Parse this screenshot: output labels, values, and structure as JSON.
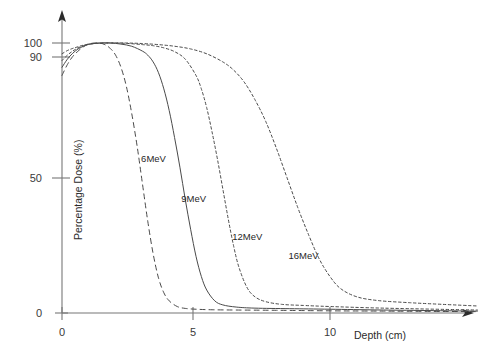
{
  "chart_data": {
    "type": "line",
    "title": "",
    "subtitle": "",
    "xlabel": "Depth (cm)",
    "ylabel": "Percentage Dose (%)",
    "xlim": [
      0,
      15.5
    ],
    "ylim": [
      0,
      108
    ],
    "xticks": [
      0,
      5,
      10
    ],
    "xticklabels": [
      "0",
      "5",
      "10"
    ],
    "yticks": [
      0,
      50,
      90,
      100
    ],
    "yticklabels": [
      "0",
      "50",
      "90",
      "100"
    ],
    "grid": false,
    "legend_position": "inline-annotations",
    "annotations": [
      {
        "text": "6MeV",
        "x": 2.95,
        "y": 56
      },
      {
        "text": "9MeV",
        "x": 4.45,
        "y": 41
      },
      {
        "text": "12MeV",
        "x": 6.35,
        "y": 27
      },
      {
        "text": "16MeV",
        "x": 8.45,
        "y": 20
      }
    ],
    "series": [
      {
        "name": "6MeV",
        "style": "dashed",
        "x": [
          0.0,
          0.2,
          0.4,
          0.6,
          0.8,
          1.0,
          1.2,
          1.4,
          1.6,
          1.8,
          2.0,
          2.2,
          2.4,
          2.6,
          2.8,
          3.0,
          3.2,
          3.4,
          3.6,
          3.8,
          4.0,
          4.3,
          4.6,
          5.0,
          5.6,
          6.5,
          8.0,
          10.0,
          12.0,
          15.5
        ],
        "y": [
          88,
          92,
          95,
          97,
          98.6,
          99.6,
          100,
          100,
          99.4,
          98,
          95.5,
          91,
          84,
          74,
          62,
          48,
          34,
          22,
          13,
          7.5,
          4.5,
          2.4,
          1.7,
          1.4,
          1.2,
          1.1,
          1.0,
          0.8,
          0.7,
          0.5
        ]
      },
      {
        "name": "9MeV",
        "style": "solid",
        "x": [
          0.0,
          0.2,
          0.4,
          0.6,
          0.8,
          1.0,
          1.4,
          1.8,
          2.2,
          2.6,
          3.0,
          3.2,
          3.4,
          3.6,
          3.8,
          4.0,
          4.2,
          4.4,
          4.6,
          4.8,
          5.0,
          5.2,
          5.4,
          5.7,
          6.0,
          6.5,
          7.2,
          8.5,
          10.0,
          12.0,
          15.5
        ],
        "y": [
          91,
          94,
          96.2,
          97.8,
          98.8,
          99.5,
          100,
          100,
          99.6,
          98.8,
          97,
          95.5,
          93,
          89,
          83,
          75,
          65,
          54,
          42,
          31,
          21,
          13.5,
          8.5,
          4.5,
          3.0,
          2.2,
          1.8,
          1.6,
          1.4,
          1.1,
          0.7
        ]
      },
      {
        "name": "12MeV",
        "style": "fine-dashed",
        "x": [
          0.0,
          0.2,
          0.4,
          0.6,
          0.8,
          1.0,
          1.5,
          2.0,
          2.5,
          3.0,
          3.4,
          3.8,
          4.2,
          4.6,
          5.0,
          5.2,
          5.4,
          5.6,
          5.8,
          6.0,
          6.2,
          6.4,
          6.6,
          6.9,
          7.2,
          7.6,
          8.2,
          9.0,
          10.0,
          12.0,
          15.5
        ],
        "y": [
          93.5,
          95.5,
          97,
          98.2,
          99,
          99.6,
          100,
          100,
          99.8,
          99.4,
          99,
          98.2,
          96.8,
          94,
          88,
          83,
          76,
          67,
          57,
          46,
          35,
          25,
          17,
          9.5,
          6.0,
          4.2,
          3.2,
          2.8,
          2.4,
          1.8,
          1.1
        ]
      },
      {
        "name": "16MeV",
        "style": "fine-dashed",
        "x": [
          0.0,
          0.2,
          0.4,
          0.6,
          0.8,
          1.2,
          1.8,
          2.4,
          3.0,
          3.6,
          4.2,
          4.8,
          5.4,
          6.0,
          6.4,
          6.8,
          7.2,
          7.6,
          8.0,
          8.4,
          8.8,
          9.2,
          9.6,
          10.0,
          10.4,
          11.0,
          11.8,
          13.0,
          14.2,
          15.5
        ],
        "y": [
          96,
          97.2,
          98,
          98.6,
          99.2,
          99.8,
          100,
          100,
          99.8,
          99.4,
          98.8,
          97.8,
          96,
          93,
          90,
          85.5,
          79,
          71,
          61,
          50,
          39,
          29,
          20,
          13.5,
          9.0,
          6.0,
          4.6,
          3.8,
          3.2,
          2.6
        ]
      }
    ],
    "colors": {
      "curve": "#4a4a4a",
      "axis": "#777777",
      "tick_text": "#3a3a3a",
      "background": "#ffffff"
    }
  }
}
